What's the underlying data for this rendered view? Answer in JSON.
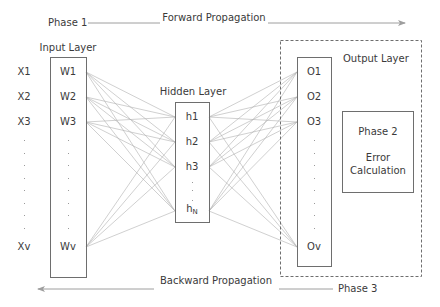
{
  "phases": {
    "phase1": "Phase 1",
    "forward": "Forward Propagation",
    "phase3": "Phase 3",
    "backward": "Backward Propagation"
  },
  "input_layer": {
    "title": "Input Layer",
    "inputs": [
      "X1",
      "X2",
      "X3",
      "Xv"
    ],
    "weights": [
      "W1",
      "W2",
      "W3",
      "Wv"
    ]
  },
  "hidden_layer": {
    "title": "Hidden Layer",
    "nodes": [
      "h1",
      "h2",
      "h3"
    ],
    "last_node_base": "h",
    "last_node_sub": "N"
  },
  "output_layer": {
    "title": "Output Layer",
    "nodes": [
      "O1",
      "O2",
      "O3",
      "Ov"
    ]
  },
  "error_box": {
    "phase": "Phase 2",
    "line1": "Error",
    "line2": "Calculation"
  },
  "colors": {
    "box_border": "#6e6e6e",
    "connection": "#a8a8a8",
    "arrow": "#9e9e9e",
    "text": "#3a3a3a"
  }
}
